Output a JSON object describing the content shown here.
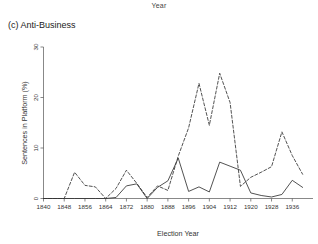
{
  "figure": {
    "super_label": "Year",
    "panel_caption": "(c) Anti-Business"
  },
  "chart_data": {
    "type": "line",
    "title": "(c) Anti-Business",
    "supertitle": "Year",
    "xlabel": "Election Year",
    "ylabel": "Sentences in Platform (%)",
    "xlim": [
      1840,
      1944
    ],
    "ylim": [
      0,
      30
    ],
    "grid": false,
    "legend": "none",
    "xticks": [
      1840,
      1848,
      1856,
      1864,
      1872,
      1880,
      1888,
      1896,
      1904,
      1912,
      1920,
      1928,
      1936
    ],
    "xticklabels": [
      "1840",
      "1848",
      "1856",
      "1864",
      "1872",
      "1880",
      "1888",
      "1896",
      "1904",
      "1912",
      "1920",
      "1928",
      "1936"
    ],
    "yticks": [
      0,
      10,
      20,
      30
    ],
    "yticklabels": [
      "0",
      "10",
      "20",
      "30"
    ],
    "x": [
      1840,
      1844,
      1848,
      1852,
      1856,
      1860,
      1864,
      1868,
      1872,
      1876,
      1880,
      1884,
      1888,
      1892,
      1896,
      1900,
      1904,
      1908,
      1912,
      1916,
      1920,
      1924,
      1928,
      1932,
      1936,
      1940
    ],
    "series": [
      {
        "name": "solid-series",
        "style": "solid",
        "values": [
          0.0,
          0.0,
          0.0,
          0.0,
          0.0,
          0.0,
          0.0,
          0.2,
          2.5,
          2.9,
          0.0,
          2.2,
          3.5,
          8.0,
          1.4,
          2.3,
          1.3,
          7.2,
          6.4,
          5.6,
          1.1,
          0.6,
          0.3,
          0.8,
          3.6,
          2.2
        ]
      },
      {
        "name": "dashed-series",
        "style": "dashed",
        "values": [
          0.0,
          0.0,
          0.0,
          5.2,
          2.6,
          2.3,
          0.0,
          2.0,
          5.6,
          3.0,
          0.2,
          2.5,
          1.6,
          8.4,
          14.0,
          22.8,
          14.5,
          24.8,
          19.0,
          2.4,
          4.2,
          5.2,
          6.3,
          13.2,
          8.5,
          4.8
        ]
      }
    ]
  }
}
